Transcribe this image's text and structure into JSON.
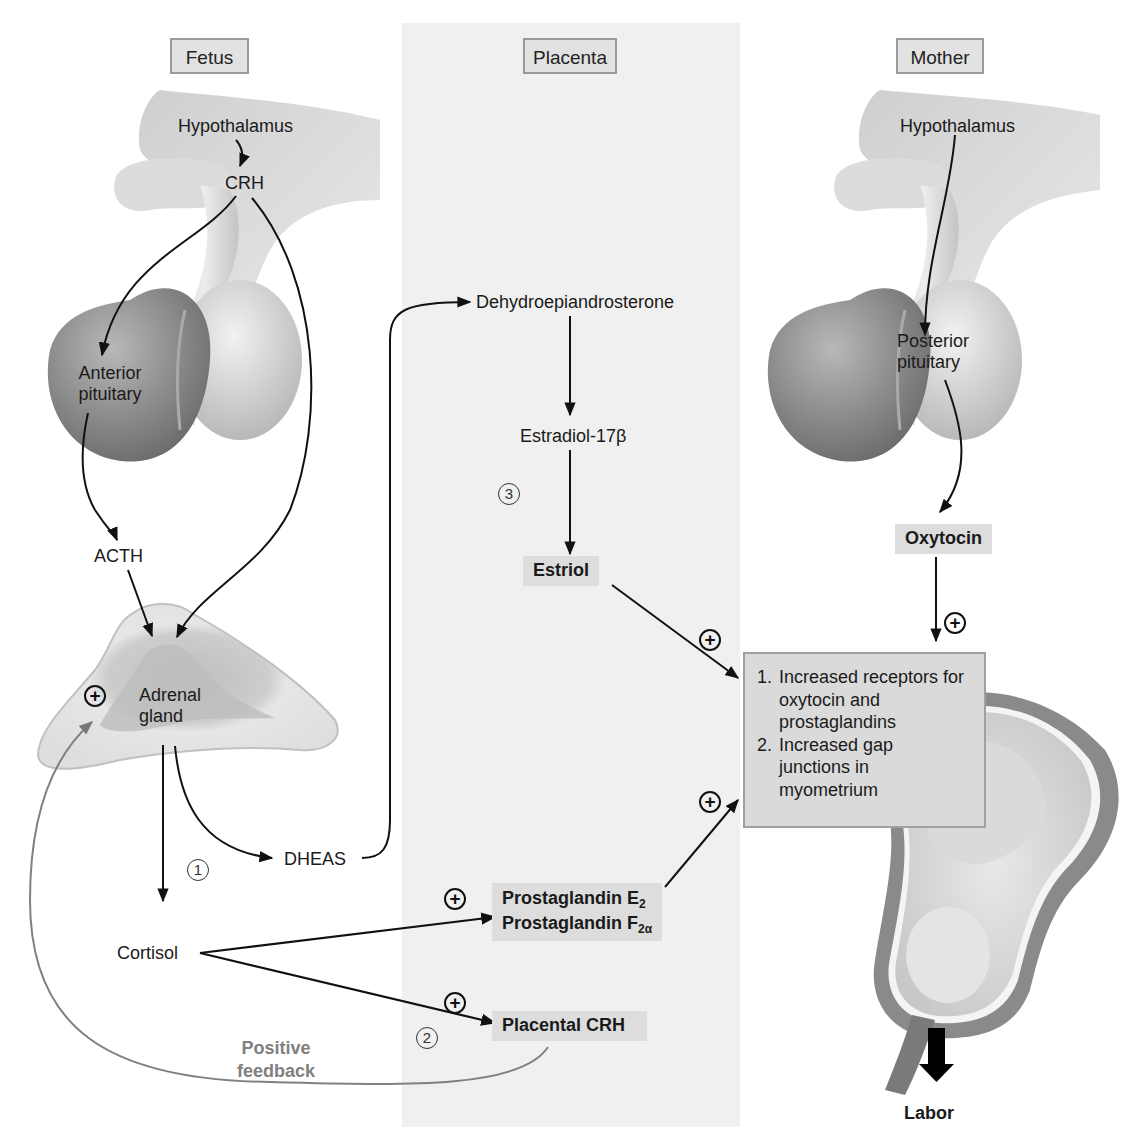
{
  "columns": {
    "fetus": "Fetus",
    "placenta": "Placenta",
    "mother": "Mother"
  },
  "fetus": {
    "hypothalamus": "Hypothalamus",
    "crh": "CRH",
    "anterior_pituitary_line1": "Anterior",
    "anterior_pituitary_line2": "pituitary",
    "acth": "ACTH",
    "adrenal_line1": "Adrenal",
    "adrenal_line2": "gland",
    "dheas": "DHEAS",
    "cortisol": "Cortisol",
    "step1": "1"
  },
  "placenta": {
    "dhea": "Dehydroepiandrosterone",
    "estradiol": "Estradiol-17β",
    "estriol": "Estriol",
    "step3": "3",
    "pge_prefix": "Prostaglandin E",
    "pge_sub": "2",
    "pgf_prefix": "Prostaglandin F",
    "pgf_sub": "2α",
    "placental_crh": "Placental CRH",
    "step2": "2"
  },
  "mother": {
    "hypothalamus": "Hypothalamus",
    "posterior_pituitary_line1": "Posterior",
    "posterior_pituitary_line2": "pituitary",
    "oxytocin": "Oxytocin"
  },
  "effects": {
    "items": [
      {
        "num": "1.",
        "text": "Increased receptors for oxytocin and prostaglandins"
      },
      {
        "num": "2.",
        "text": "Increased gap junctions in myometrium"
      }
    ]
  },
  "feedback": {
    "line1": "Positive",
    "line2": "feedback"
  },
  "outcome": {
    "label": "Labor"
  },
  "symbols": {
    "plus": "+",
    "plus_icon": "circled-plus-icon"
  },
  "colors": {
    "placenta_band": "#f0f0f0",
    "label_box": "#dddddd",
    "feedback_gray": "#808080",
    "arrow": "#111111"
  }
}
